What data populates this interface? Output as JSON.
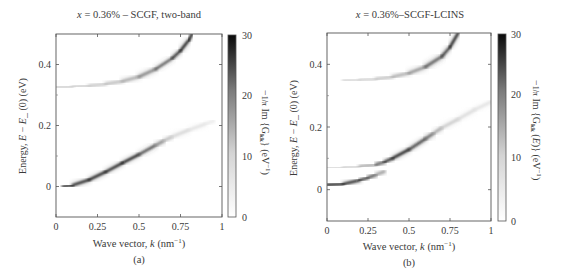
{
  "figure": {
    "panels": [
      {
        "id": "a",
        "title": "x = 0.36% – SCGF, two-band",
        "title_italic_prefix": "x",
        "title_rest": " = 0.36% – SCGF, two-band",
        "caption": "(a)",
        "xlabel": "Wave vector, k (nm⁻¹)",
        "ylabel": "Energy, E – E_ (0) (eV)",
        "colorbar_label": "−(1/π) Im {G_kk} (eV⁻¹)",
        "colorbar_ticks": [
          "0",
          "10",
          "20",
          "30"
        ]
      },
      {
        "id": "b",
        "title": "x = 0.36%–SCGF-LCINS",
        "title_italic_prefix": "x",
        "title_rest": " = 0.36%–SCGF-LCINS",
        "caption": "(b)",
        "xlabel": "Wave vector, k (nm⁻¹)",
        "ylabel": "Energy, E – E_ (0) (eV)",
        "colorbar_label": "−(1/π) Im {G_kk (E)} (eV⁻¹)",
        "colorbar_ticks": [
          "0",
          "10",
          "20",
          "30"
        ]
      }
    ]
  },
  "chart_data": [
    {
      "type": "heatmap",
      "title": "x = 0.36% – SCGF, two-band",
      "xlabel": "Wave vector, k (nm⁻¹)",
      "ylabel": "Energy, E – E_ (0) (eV)",
      "xlim": [
        0,
        1
      ],
      "ylim": [
        -0.1,
        0.5
      ],
      "xticks": [
        "0",
        "0.25",
        "0.5",
        "0.75",
        "1"
      ],
      "yticks": [
        "0",
        "0.2",
        "0.4"
      ],
      "colorbar": {
        "label": "−(1/π) Im {G_kk} (eV⁻¹)",
        "range": [
          0,
          30
        ],
        "ticks": [
          0,
          10,
          20,
          30
        ],
        "colormap": "white-to-black"
      },
      "grid": false,
      "series": [
        {
          "name": "upper band",
          "k": [
            0,
            0.1,
            0.2,
            0.3,
            0.4,
            0.5,
            0.6,
            0.7,
            0.75,
            0.8,
            0.82
          ],
          "E": [
            0.326,
            0.327,
            0.33,
            0.336,
            0.345,
            0.36,
            0.385,
            0.42,
            0.445,
            0.48,
            0.5
          ],
          "intensity": [
            6,
            6,
            6,
            7,
            9,
            12,
            18,
            26,
            28,
            30,
            30
          ]
        },
        {
          "name": "lower band",
          "k": [
            0.04,
            0.1,
            0.2,
            0.3,
            0.4,
            0.5,
            0.6,
            0.65,
            0.7,
            0.8,
            0.9,
            0.95
          ],
          "E": [
            0.0,
            0.004,
            0.022,
            0.048,
            0.077,
            0.105,
            0.135,
            0.15,
            0.163,
            0.185,
            0.205,
            0.215
          ],
          "intensity": [
            30,
            30,
            30,
            30,
            30,
            28,
            18,
            10,
            6,
            4,
            3,
            2
          ]
        }
      ]
    },
    {
      "type": "heatmap",
      "title": "x = 0.36%–SCGF-LCINS",
      "xlabel": "Wave vector, k (nm⁻¹)",
      "ylabel": "Energy, E – E_ (0) (eV)",
      "xlim": [
        0,
        1
      ],
      "ylim": [
        -0.1,
        0.5
      ],
      "xticks": [
        "0",
        "0.25",
        "0.5",
        "0.75",
        "1"
      ],
      "yticks": [
        "0",
        "0.2",
        "0.4"
      ],
      "colorbar": {
        "label": "−(1/π) Im {G_kk (E)} (eV⁻¹)",
        "range": [
          0,
          30
        ],
        "ticks": [
          0,
          10,
          20,
          30
        ],
        "colormap": "white-to-black"
      },
      "grid": false,
      "series": [
        {
          "name": "upper band",
          "k": [
            0,
            0.1,
            0.2,
            0.3,
            0.4,
            0.5,
            0.6,
            0.7,
            0.75,
            0.8
          ],
          "E": [
            0.348,
            0.348,
            0.35,
            0.353,
            0.36,
            0.372,
            0.392,
            0.425,
            0.455,
            0.5
          ],
          "intensity": [
            5,
            5,
            5,
            6,
            8,
            11,
            16,
            24,
            28,
            30
          ]
        },
        {
          "name": "lower band (low branch)",
          "k": [
            0,
            0.1,
            0.2,
            0.25,
            0.3,
            0.35
          ],
          "E": [
            0.015,
            0.018,
            0.03,
            0.038,
            0.048,
            0.058
          ],
          "intensity": [
            30,
            30,
            28,
            24,
            16,
            8
          ]
        },
        {
          "name": "lower band (upper branch)",
          "k": [
            0,
            0.1,
            0.2,
            0.3,
            0.35,
            0.4,
            0.5,
            0.6,
            0.65,
            0.7,
            0.8,
            0.9,
            1.0
          ],
          "E": [
            0.07,
            0.071,
            0.074,
            0.08,
            0.088,
            0.1,
            0.128,
            0.162,
            0.18,
            0.197,
            0.225,
            0.255,
            0.28
          ],
          "intensity": [
            5,
            5,
            6,
            14,
            24,
            30,
            30,
            22,
            14,
            8,
            5,
            4,
            3
          ]
        }
      ]
    }
  ]
}
